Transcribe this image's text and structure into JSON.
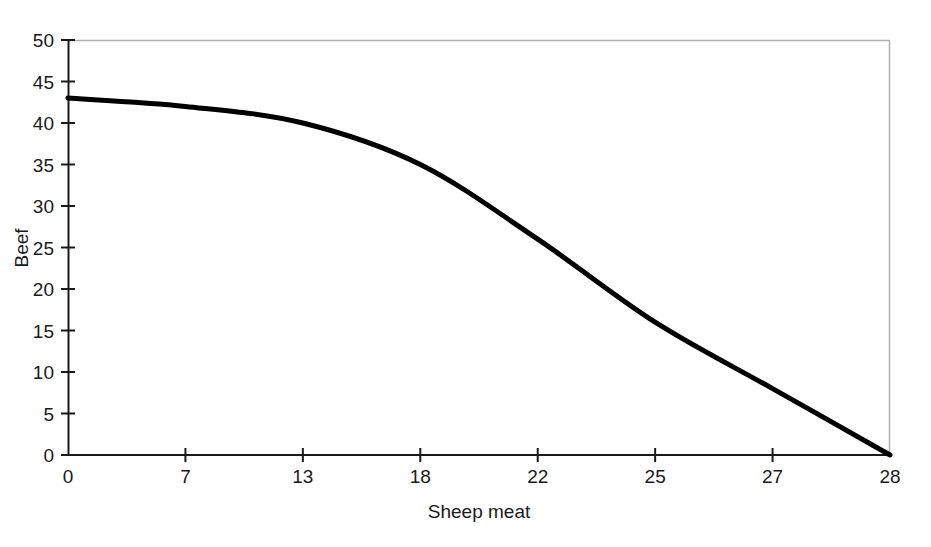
{
  "chart_data": {
    "type": "line",
    "title": "",
    "subtitle": "",
    "xlabel": "Sheep meat",
    "ylabel": "Beef",
    "x_tick_labels": [
      "0",
      "7",
      "13",
      "18",
      "22",
      "25",
      "27",
      "28"
    ],
    "x_tick_values": [
      0,
      7,
      13,
      18,
      22,
      25,
      27,
      28
    ],
    "x_axis_scale": "ordinal-evenly-spaced",
    "y_tick_labels": [
      "0",
      "5",
      "10",
      "15",
      "20",
      "25",
      "30",
      "35",
      "40",
      "45",
      "50"
    ],
    "y_tick_values": [
      0,
      5,
      10,
      15,
      20,
      25,
      30,
      35,
      40,
      45,
      50
    ],
    "ylim": [
      0,
      50
    ],
    "grid": false,
    "legend": "none",
    "series": [
      {
        "name": "Production possibility frontier",
        "x": [
          0,
          7,
          13,
          18,
          22,
          25,
          27,
          28
        ],
        "values": [
          43,
          42,
          40,
          35,
          26,
          16,
          8,
          0
        ],
        "color": "#000000",
        "line_width": 5
      }
    ],
    "annotations": []
  },
  "axes": {
    "axis_color": "#1a1a1a",
    "frame_color": "#b0b0b0",
    "tick_color": "#1a1a1a"
  },
  "labels": {
    "y_axis_title": "Beef",
    "x_axis_title": "Sheep meat"
  }
}
